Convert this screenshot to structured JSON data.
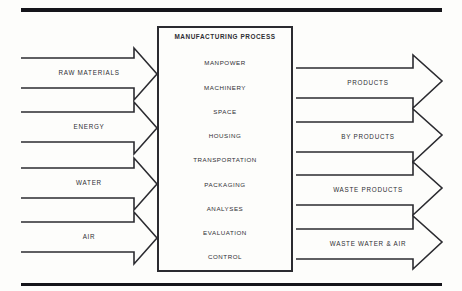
{
  "diagram": {
    "title": "MANUFACTURING PROCESS",
    "process_box": {
      "label": "MANUFACTURING PROCESS",
      "items": [
        "MANPOWER",
        "MACHINERY",
        "SPACE",
        "HOUSING",
        "TRANSPORTATION",
        "PACKAGING",
        "ANALYSES",
        "EVALUATION",
        "CONTROL"
      ]
    },
    "inputs": [
      {
        "label": "RAW MATERIALS"
      },
      {
        "label": "ENERGY"
      },
      {
        "label": "WATER"
      },
      {
        "label": "AIR"
      }
    ],
    "outputs": [
      {
        "label": "PRODUCTS"
      },
      {
        "label": "BY PRODUCTS"
      },
      {
        "label": "WASTE PRODUCTS"
      },
      {
        "label": "WASTE WATER & AIR"
      }
    ],
    "colors": {
      "stroke": "#2b2b30",
      "rule": "#15151a",
      "text": "#2e2e33",
      "background": "#fdfdfb"
    }
  }
}
